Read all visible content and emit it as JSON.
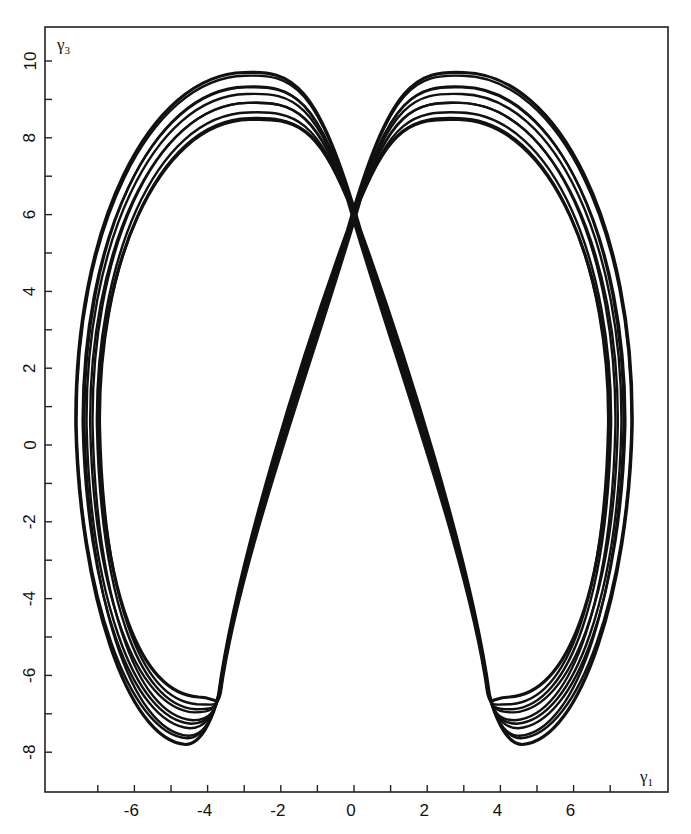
{
  "chart_data": {
    "type": "line",
    "title": "",
    "xlabel": "γ1",
    "ylabel": "γ3",
    "xlim": [
      -8.6,
      8.7
    ],
    "ylim": [
      -9.2,
      10.9
    ],
    "grid": false,
    "legend": null,
    "x_ticks": {
      "major": [
        -6,
        -4,
        -2,
        0,
        2,
        4,
        6
      ],
      "minor": [
        -7,
        -5,
        -3,
        -1,
        1,
        3,
        5,
        7
      ],
      "labels": [
        "-6",
        "-4",
        "-2",
        "0",
        "2",
        "4",
        "6"
      ]
    },
    "y_ticks": {
      "major": [
        -8,
        -6,
        -4,
        -2,
        0,
        2,
        4,
        6,
        8,
        10
      ],
      "minor": [
        -7,
        -5,
        -3,
        -1,
        1,
        3,
        5,
        7,
        9
      ],
      "labels": [
        "-8",
        "-6",
        "-4",
        "-2",
        "0",
        "2",
        "4",
        "6",
        "8",
        "10"
      ]
    },
    "key_points": {
      "crossing": [
        0,
        6.0
      ],
      "left_peak": [
        -2.9,
        9.6
      ],
      "right_peak": [
        3.0,
        9.6
      ],
      "left_outer_extreme": [
        -7.5,
        0
      ],
      "right_outer_extreme": [
        7.6,
        0
      ],
      "left_bottom": [
        -4.6,
        -7.8
      ],
      "right_bottom": [
        4.6,
        -7.8
      ],
      "left_cusp": [
        -3.7,
        -6.5
      ],
      "right_cusp": [
        3.7,
        -6.5
      ]
    },
    "strands": 10,
    "strand_spread": {
      "outer_peak": 9.7,
      "inner_peak": 8.4,
      "outer_bottom": -7.8,
      "inner_bottom": -6.6
    }
  },
  "labels": {
    "x_axis_title_main": "γ",
    "x_axis_title_sub": "1",
    "y_axis_title_main": "γ",
    "y_axis_title_sub": "3"
  },
  "style": {
    "line_color": "#111111",
    "axis_color": "#222222",
    "background": "#ffffff"
  }
}
